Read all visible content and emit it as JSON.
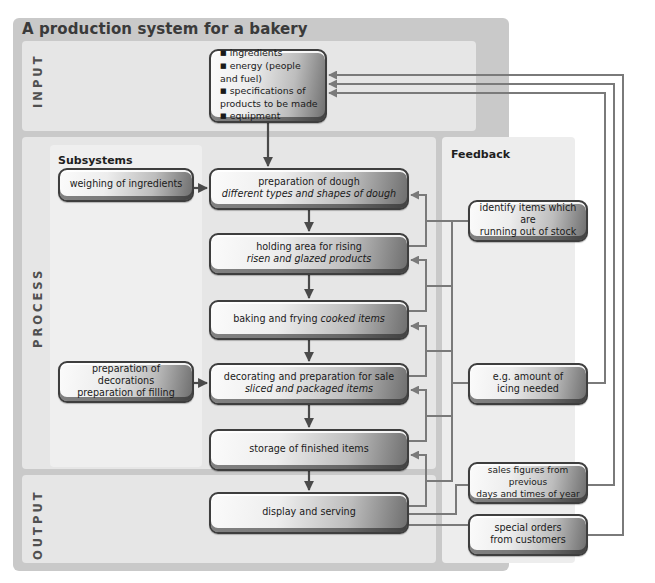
{
  "title": "A production system for a bakery",
  "sections": {
    "input": "INPUT",
    "process": "PROCESS",
    "output": "OUTPUT",
    "subsystems": "Subsystems",
    "feedback": "Feedback"
  },
  "input_box": {
    "items": [
      "ingredients",
      "energy (people and fuel)",
      "specifications of products to be made",
      "equipment"
    ]
  },
  "process_steps": [
    {
      "label": "preparation of dough",
      "detail": "different types and shapes of dough"
    },
    {
      "label": "holding area for rising",
      "detail": "risen and glazed products"
    },
    {
      "label": "baking and frying",
      "detail": "cooked items"
    },
    {
      "label": "decorating and preparation for sale",
      "detail": "sliced and packaged items"
    },
    {
      "label": "storage of finished items",
      "detail": ""
    }
  ],
  "output_box": {
    "label": "display and serving"
  },
  "subsystems": [
    {
      "lines": [
        "weighing of ingredients"
      ]
    },
    {
      "lines": [
        "preparation of decorations",
        "preparation of filling"
      ]
    }
  ],
  "feedback": [
    {
      "lines": [
        "identify items which are",
        "running out of stock"
      ]
    },
    {
      "lines": [
        "e.g. amount of",
        "icing needed"
      ]
    },
    {
      "lines": [
        "sales figures from previous",
        "days and times of year"
      ]
    },
    {
      "lines": [
        "special orders",
        "from customers"
      ]
    }
  ],
  "colors": {
    "frame": "#c9c9c9",
    "band": "#e6e6e6",
    "arrow_dark": "#4a4a4a",
    "arrow_feedback": "#7a7a7a"
  }
}
